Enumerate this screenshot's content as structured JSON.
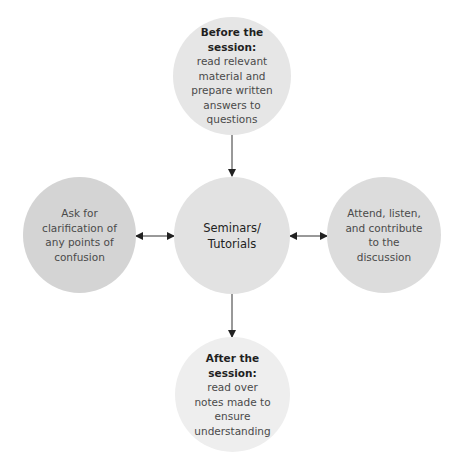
{
  "diagram": {
    "center": {
      "title_lines": [
        "Seminars/",
        "Tutorials"
      ],
      "fill": "#e2e2e2"
    },
    "top": {
      "heading": "Before the session:",
      "body_lines": [
        "read relevant",
        "material and",
        "prepare written",
        "answers to",
        "questions"
      ],
      "fill": "#e6e6e6"
    },
    "left": {
      "body_lines": [
        "Ask for",
        "clarification of",
        "any points of",
        "confusion"
      ],
      "fill": "#d4d4d4"
    },
    "right": {
      "body_lines": [
        "Attend, listen,",
        "and contribute",
        "to the",
        "discussion"
      ],
      "fill": "#dcdcdc"
    },
    "bottom": {
      "heading_lines": [
        "After the",
        "session:"
      ],
      "body_lines": [
        "read over",
        "notes made to",
        "ensure",
        "understanding"
      ],
      "fill": "#eeeeee"
    },
    "arrows": [
      {
        "from": "top",
        "to": "center",
        "type": "single"
      },
      {
        "from": "center",
        "to": "bottom",
        "type": "single"
      },
      {
        "from": "left",
        "to": "center",
        "type": "double"
      },
      {
        "from": "center",
        "to": "right",
        "type": "double"
      }
    ],
    "arrow_color": "#222222"
  }
}
